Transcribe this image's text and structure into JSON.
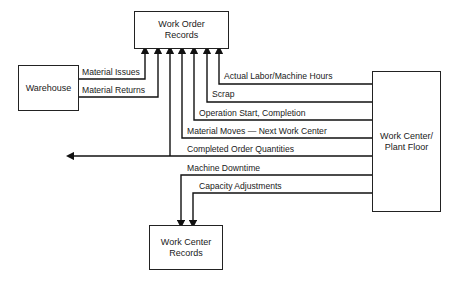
{
  "boxes": {
    "work_order_records": {
      "line1": "Work Order",
      "line2": "Records"
    },
    "warehouse": {
      "line1": "Warehouse"
    },
    "work_center_plant_floor": {
      "line1": "Work Center/",
      "line2": "Plant Floor"
    },
    "work_center_records": {
      "line1": "Work Center",
      "line2": "Records"
    }
  },
  "flows": {
    "warehouse_to_wor": [
      "Material Issues",
      "Material Returns"
    ],
    "plant_floor_to_wor": [
      "Actual Labor/Machine Hours",
      "Scrap",
      "Operation Start, Completion",
      "Material Moves — Next Work Center",
      "Completed Order Quantities"
    ],
    "plant_floor_to_wcr": [
      "Machine Downtime",
      "Capacity Adjustments"
    ]
  }
}
